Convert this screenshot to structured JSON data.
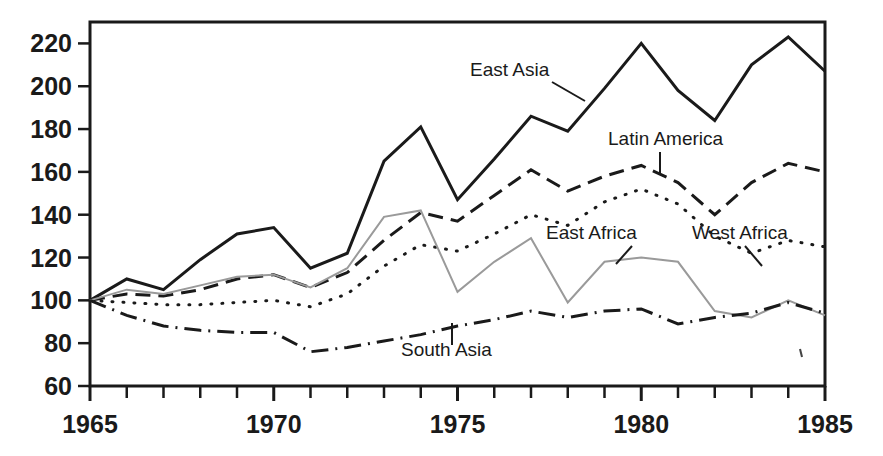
{
  "chart_data": {
    "type": "line",
    "title": "",
    "subtitle": "",
    "xlabel": "",
    "ylabel": "",
    "xlim": [
      1965,
      1985
    ],
    "ylim": [
      60,
      230
    ],
    "grid": false,
    "legend_position": "inline-annotations",
    "x": [
      1965,
      1966,
      1967,
      1968,
      1969,
      1970,
      1971,
      1972,
      1973,
      1974,
      1975,
      1976,
      1977,
      1978,
      1979,
      1980,
      1981,
      1982,
      1983,
      1984,
      1985
    ],
    "xticks": [
      1965,
      1966,
      1967,
      1968,
      1969,
      1970,
      1971,
      1972,
      1973,
      1974,
      1975,
      1976,
      1977,
      1978,
      1979,
      1980,
      1981,
      1982,
      1983,
      1984,
      1985
    ],
    "xtick_labels": [
      "1965",
      "",
      "",
      "",
      "",
      "1970",
      "",
      "",
      "",
      "",
      "1975",
      "",
      "",
      "",
      "",
      "1980",
      "",
      "",
      "",
      "",
      "1985"
    ],
    "yticks": [
      60,
      80,
      100,
      120,
      140,
      160,
      180,
      200,
      220
    ],
    "ytick_labels": [
      "60",
      "80",
      "100",
      "120",
      "140",
      "160",
      "180",
      "200",
      "220"
    ],
    "series": [
      {
        "name": "East Asia",
        "style": "solid",
        "color": "#1a1a1a",
        "width": 3,
        "values": [
          100,
          110,
          105,
          119,
          131,
          134,
          115,
          122,
          165,
          181,
          147,
          166,
          186,
          179,
          199,
          220,
          198,
          184,
          210,
          223,
          207
        ]
      },
      {
        "name": "Latin America",
        "style": "dashed",
        "color": "#1a1a1a",
        "width": 3,
        "values": [
          100,
          103,
          102,
          105,
          110,
          112,
          106,
          113,
          128,
          141,
          137,
          149,
          161,
          151,
          158,
          163,
          155,
          140,
          155,
          164,
          160
        ]
      },
      {
        "name": "West Africa",
        "style": "dotted",
        "color": "#1a1a1a",
        "width": 3,
        "values": [
          100,
          99,
          98,
          98,
          99,
          100,
          97,
          103,
          116,
          126,
          123,
          131,
          140,
          135,
          146,
          152,
          145,
          130,
          122,
          128,
          125
        ]
      },
      {
        "name": "East Africa",
        "style": "solid",
        "color": "#9a9a9a",
        "width": 2,
        "values": [
          100,
          105,
          103,
          107,
          111,
          112,
          106,
          115,
          139,
          142,
          104,
          118,
          129,
          99,
          118,
          120,
          118,
          95,
          92,
          100,
          93
        ]
      },
      {
        "name": "South Asia",
        "style": "dashdot",
        "color": "#1a1a1a",
        "width": 3,
        "values": [
          100,
          93,
          88,
          86,
          85,
          85,
          76,
          78,
          81,
          84,
          88,
          91,
          95,
          92,
          95,
          96,
          89,
          92,
          94,
          99,
          94
        ]
      }
    ],
    "annotations": [
      {
        "text": "East Asia",
        "x": 470,
        "y": 76,
        "leader": [
          [
            552,
            82
          ],
          [
            585,
            101
          ]
        ]
      },
      {
        "text": "Latin America",
        "x": 608,
        "y": 145,
        "leader": [
          [
            660,
            152
          ],
          [
            660,
            174
          ]
        ]
      },
      {
        "text": "East Africa",
        "x": 546,
        "y": 239,
        "leader": [
          [
            632,
            246
          ],
          [
            616,
            264
          ]
        ]
      },
      {
        "text": "West Africa",
        "x": 692,
        "y": 239,
        "leader": [
          [
            745,
            246
          ],
          [
            762,
            266
          ]
        ]
      },
      {
        "text": "South Asia",
        "x": 401,
        "y": 356,
        "leader": [
          [
            452,
            323
          ],
          [
            452,
            345
          ]
        ]
      }
    ]
  },
  "axes": {
    "plot_left": 90,
    "plot_right": 825,
    "plot_top": 22,
    "plot_bottom": 386
  }
}
